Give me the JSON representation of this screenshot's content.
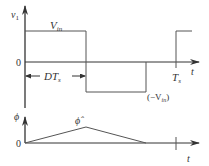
{
  "top_plot": {
    "y_label": "v",
    "y_label_sub": "1",
    "high_label": "V",
    "high_label_sub": "in",
    "zero_label": "0",
    "duty_label": "DT",
    "duty_label_sub": "s",
    "period_label": "T",
    "period_label_sub": "s",
    "x_label": "t",
    "low_label_prefix": "(−V",
    "low_label_sub": "in",
    "low_label_suffix": ")"
  },
  "bottom_plot": {
    "y_label": "ϕ",
    "peak_label": "ϕ̂",
    "zero_label": "0",
    "x_label": "t"
  },
  "colors": {
    "line": "#555555",
    "axis": "#333333"
  }
}
